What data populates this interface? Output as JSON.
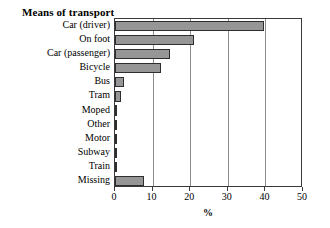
{
  "chart_data": {
    "type": "bar",
    "orientation": "horizontal",
    "title": "Means of transport",
    "xlabel": "%",
    "ylabel": "",
    "xlim": [
      0,
      50
    ],
    "xticks": [
      0,
      10,
      20,
      30,
      40,
      50
    ],
    "xtick_labels": [
      "0",
      "10",
      "20",
      "30",
      "40",
      "50"
    ],
    "grid": true,
    "grid_axis": "x",
    "legend": false,
    "bar_color": "#969696",
    "bar_edge_color": "#2e2e2e",
    "categories": [
      "Car (driver)",
      "On foot",
      "Car (passenger)",
      "Bicycle",
      "Bus",
      "Tram",
      "Moped",
      "Other",
      "Motor",
      "Subway",
      "Train",
      "Missing"
    ],
    "values": [
      39.7,
      20.9,
      14.6,
      12.3,
      2.3,
      1.5,
      0.6,
      0.5,
      0.3,
      0.1,
      0.1,
      7.6
    ]
  }
}
